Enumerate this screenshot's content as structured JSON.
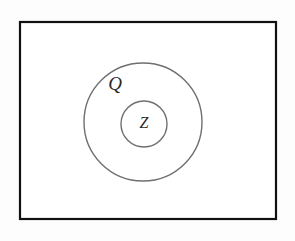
{
  "diagram": {
    "type": "euler-venn-nested-sets",
    "universe": {
      "name": "universe-rectangle",
      "x": 20,
      "y": 22,
      "width": 256,
      "height": 197,
      "border_color": "#111111",
      "fill_color": "#ffffff"
    },
    "sets": [
      {
        "id": "outer",
        "label": "Q",
        "label_x": 115,
        "label_y": 86,
        "label_size": 19,
        "cx": 143,
        "cy": 122,
        "r": 59,
        "stroke_color": "#6f6f6f"
      },
      {
        "id": "inner",
        "label": "Z",
        "label_x": 144,
        "label_y": 124,
        "label_size": 16,
        "cx": 144,
        "cy": 124,
        "r": 23,
        "stroke_color": "#6f6f6f"
      }
    ]
  }
}
